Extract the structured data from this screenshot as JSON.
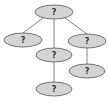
{
  "diagram": {
    "type": "tree",
    "colors": {
      "node_fill": "#d4d4d4",
      "node_stroke": "#555555",
      "edge": "#666666",
      "label": "#333333"
    },
    "nodes": [
      {
        "id": "root",
        "label": "?",
        "cx": 54,
        "cy": 12,
        "rx": 19,
        "ry": 7
      },
      {
        "id": "left",
        "label": "?",
        "cx": 23,
        "cy": 40,
        "rx": 19,
        "ry": 7
      },
      {
        "id": "middle",
        "label": "?",
        "cx": 54,
        "cy": 55,
        "rx": 18,
        "ry": 7
      },
      {
        "id": "right",
        "label": "?",
        "cx": 87,
        "cy": 41,
        "rx": 19,
        "ry": 7
      },
      {
        "id": "right-child",
        "label": "?",
        "cx": 87,
        "cy": 71,
        "rx": 18,
        "ry": 7
      },
      {
        "id": "bottom",
        "label": "?",
        "cx": 54,
        "cy": 89,
        "rx": 18,
        "ry": 7
      }
    ],
    "edges": [
      {
        "from": "root",
        "to": "left"
      },
      {
        "from": "root",
        "to": "middle"
      },
      {
        "from": "root",
        "to": "right"
      },
      {
        "from": "middle",
        "to": "bottom"
      },
      {
        "from": "right",
        "to": "right-child"
      }
    ]
  }
}
